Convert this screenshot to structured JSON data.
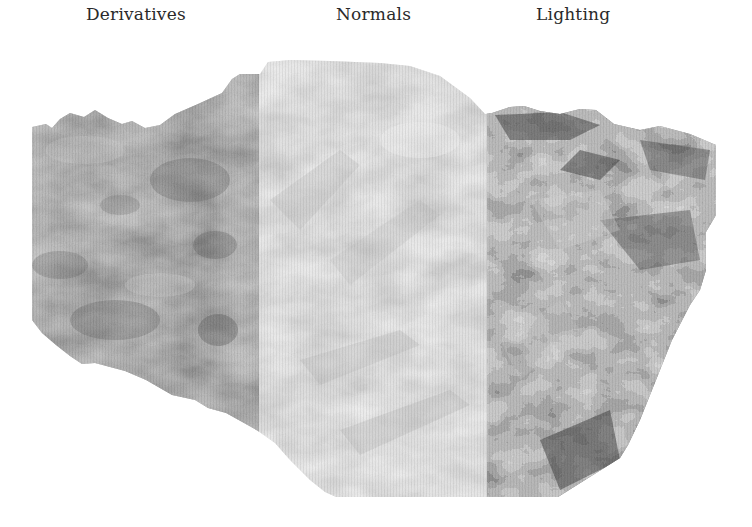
{
  "figure": {
    "panels": [
      {
        "id": "derivatives",
        "label": "Derivatives",
        "tone": "medium-gray",
        "base_color": "#9a9a9a",
        "shadow_color": "#5a5a5a",
        "highlight_color": "#c8c8c8"
      },
      {
        "id": "normals",
        "label": "Normals",
        "tone": "light-gray",
        "base_color": "#e2e2e2",
        "shadow_color": "#b8b8b8",
        "highlight_color": "#f6f6f6"
      },
      {
        "id": "lighting",
        "label": "Lighting",
        "tone": "high-contrast",
        "base_color": "#7a7a7a",
        "shadow_color": "#2c2c2c",
        "highlight_color": "#d0d0d0"
      }
    ],
    "background": "#ffffff"
  }
}
